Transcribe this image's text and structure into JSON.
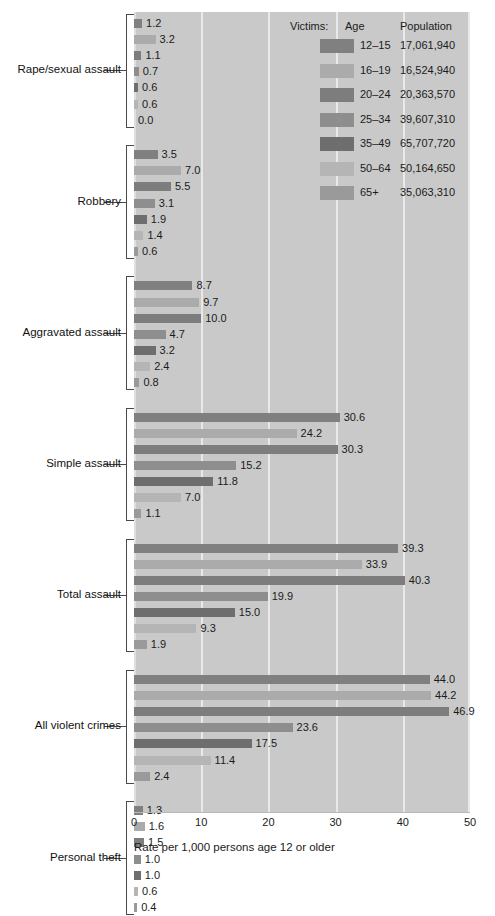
{
  "chart_data": {
    "type": "bar",
    "orientation": "horizontal",
    "title": "",
    "xlabel": "Rate per 1,000 persons age 12 or older",
    "ylabel": "",
    "xlim": [
      0,
      50
    ],
    "xticks": [
      0,
      10,
      20,
      30,
      40,
      50
    ],
    "grid": true,
    "legend_position": "top-right",
    "legend_title": "Victims:",
    "legend_columns": [
      "Victims:",
      "Age",
      "Population"
    ],
    "series": [
      {
        "name": "12–15",
        "population": "17,061,940",
        "color": "#808080",
        "values": [
          1.2,
          3.5,
          8.7,
          30.6,
          39.3,
          44.0,
          1.3
        ]
      },
      {
        "name": "16–19",
        "population": "16,524,940",
        "color": "#ababab",
        "values": [
          3.2,
          7.0,
          9.7,
          24.2,
          33.9,
          44.2,
          1.6
        ]
      },
      {
        "name": "20–24",
        "population": "20,363,570",
        "color": "#7d7d7d",
        "values": [
          1.1,
          5.5,
          10.0,
          30.3,
          40.3,
          46.9,
          1.5
        ]
      },
      {
        "name": "25–34",
        "population": "39,607,310",
        "color": "#8e8e8e",
        "values": [
          0.7,
          3.1,
          4.7,
          15.2,
          19.9,
          23.6,
          1.0
        ]
      },
      {
        "name": "35–49",
        "population": "65,707,720",
        "color": "#6e6e6e",
        "values": [
          0.6,
          1.9,
          3.2,
          11.8,
          15.0,
          17.5,
          1.0
        ]
      },
      {
        "name": "50–64",
        "population": "50,164,650",
        "color": "#b5b5b5",
        "values": [
          0.6,
          1.4,
          2.4,
          7.0,
          9.3,
          11.4,
          0.6
        ]
      },
      {
        "name": "65+",
        "population": "35,063,310",
        "color": "#9a9a9a",
        "values": [
          0.0,
          0.6,
          0.8,
          1.1,
          1.9,
          2.4,
          0.4
        ]
      }
    ],
    "categories": [
      "Rape/sexual assault",
      "Robbery",
      "Aggravated assault",
      "Simple assault",
      "Total assault",
      "All violent crimes",
      "Personal theft"
    ],
    "groups": [
      {
        "label": "Rape/sexual assault",
        "values": [
          1.2,
          3.2,
          1.1,
          0.7,
          0.6,
          0.6,
          0.0
        ],
        "labels": [
          "1.2",
          "3.2",
          "1.1",
          "0.7",
          "0.6",
          "0.6",
          "0.0"
        ]
      },
      {
        "label": "Robbery",
        "values": [
          3.5,
          7.0,
          5.5,
          3.1,
          1.9,
          1.4,
          0.6
        ],
        "labels": [
          "3.5",
          "7.0",
          "5.5",
          "3.1",
          "1.9",
          "1.4",
          "0.6"
        ]
      },
      {
        "label": "Aggravated assault",
        "values": [
          8.7,
          9.7,
          10.0,
          4.7,
          3.2,
          2.4,
          0.8
        ],
        "labels": [
          "8.7",
          "9.7",
          "10.0",
          "4.7",
          "3.2",
          "2.4",
          "0.8"
        ]
      },
      {
        "label": "Simple assault",
        "values": [
          30.6,
          24.2,
          30.3,
          15.2,
          11.8,
          7.0,
          1.1
        ],
        "labels": [
          "30.6",
          "24.2",
          "30.3",
          "15.2",
          "11.8",
          "7.0",
          "1.1"
        ]
      },
      {
        "label": "Total assault",
        "values": [
          39.3,
          33.9,
          40.3,
          19.9,
          15.0,
          9.3,
          1.9
        ],
        "labels": [
          "39.3",
          "33.9",
          "40.3",
          "19.9",
          "15.0",
          "9.3",
          "1.9"
        ]
      },
      {
        "label": "All violent crimes",
        "values": [
          44.0,
          44.2,
          46.9,
          23.6,
          17.5,
          11.4,
          2.4
        ],
        "labels": [
          "44.0",
          "44.2",
          "46.9",
          "23.6",
          "17.5",
          "11.4",
          "2.4"
        ]
      },
      {
        "label": "Personal theft",
        "values": [
          1.3,
          1.6,
          1.5,
          1.0,
          1.0,
          0.6,
          0.4
        ],
        "labels": [
          "1.3",
          "1.6",
          "1.5",
          "1.0",
          "1.0",
          "0.6",
          "0.4"
        ]
      }
    ]
  },
  "axis": {
    "tick_labels": [
      "0",
      "10",
      "20",
      "30",
      "40",
      "50"
    ],
    "title": "Rate per 1,000 persons age 12 or older"
  },
  "legend": {
    "header_victims": "Victims:",
    "header_age": "Age",
    "header_population": "Population",
    "rows": [
      {
        "age": "12–15",
        "population": "17,061,940"
      },
      {
        "age": "16–19",
        "population": "16,524,940"
      },
      {
        "age": "20–24",
        "population": "20,363,570"
      },
      {
        "age": "25–34",
        "population": "39,607,310"
      },
      {
        "age": "35–49",
        "population": "65,707,720"
      },
      {
        "age": "50–64",
        "population": "50,164,650"
      },
      {
        "age": "65+",
        "population": "35,063,310"
      }
    ]
  },
  "colors": {
    "plot_background": "#c9c9c9",
    "gridline": "#e9e9e9",
    "text": "#1b1b1b",
    "bracket": "#4a4a4a"
  }
}
